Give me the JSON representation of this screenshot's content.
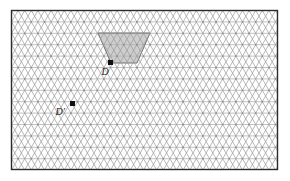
{
  "figure": {
    "canvas": {
      "width": 290,
      "height": 181,
      "background": "#ffffff"
    },
    "frame": {
      "name": "bounding-rectangle",
      "x": 11.5,
      "y": 10.5,
      "width": 266,
      "height": 159,
      "stroke": "#2b2b2b",
      "stroke_width": 1.4,
      "fill": "#ffffff"
    },
    "lattice": {
      "type": "triangular",
      "row_height": 11.4,
      "column_width": 13.2,
      "stroke": "#9a9a9a",
      "stroke_width": 0.7,
      "horizontal_stroke": "#a8a8a8",
      "vertex_dot_color": "#8c8c8c",
      "vertex_dot_radius": 0.85
    },
    "shaded_region": {
      "name": "fundamental-domain-trapezoid",
      "shape": "trapezoid",
      "fill": "#b0b0b0",
      "fill_opacity": 0.62,
      "stroke": "#6e6e6e",
      "stroke_width": 1.0,
      "vertices": [
        {
          "x": 98,
          "y": 33
        },
        {
          "x": 150,
          "y": 33
        },
        {
          "x": 137,
          "y": 63
        },
        {
          "x": 111,
          "y": 63
        }
      ]
    },
    "points": [
      {
        "id": "D",
        "label": "D",
        "x": 110.5,
        "y": 62.5,
        "marker": "square",
        "size": 5.0,
        "color": "#111111",
        "label_dx": -9,
        "label_dy": 4
      },
      {
        "id": "Dprime",
        "label": "D′",
        "x": 72.5,
        "y": 103.5,
        "marker": "square",
        "size": 5.0,
        "color": "#111111",
        "label_dx": -17,
        "label_dy": 3
      }
    ]
  }
}
